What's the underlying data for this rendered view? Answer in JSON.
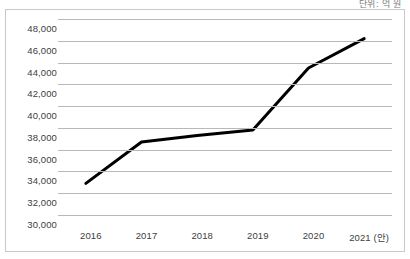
{
  "caption": {
    "text": "단위: 억 원"
  },
  "chart_data": {
    "type": "line",
    "title": "",
    "subtitle": "",
    "xlabel": "",
    "ylabel": "",
    "categories": [
      "2016",
      "2017",
      "2018",
      "2019",
      "2020",
      "2021 (안)"
    ],
    "values": [
      32900,
      36700,
      37300,
      37800,
      43500,
      46200
    ],
    "series": [
      {
        "name": "",
        "values": [
          32900,
          36700,
          37300,
          37800,
          43500,
          46200
        ],
        "color": "#000000"
      }
    ],
    "ylim": [
      30000,
      48000
    ],
    "ytick_values": [
      48000,
      46000,
      44000,
      42000,
      40000,
      38000,
      36000,
      34000,
      32000,
      30000
    ],
    "ytick_labels": [
      "48,000",
      "46,000",
      "44,000",
      "42,000",
      "40,000",
      "38,000",
      "36,000",
      "34,000",
      "32,000",
      "30,000"
    ],
    "xtick_labels": [
      "2016",
      "2017",
      "2018",
      "2019",
      "2020",
      "2021 (안)"
    ],
    "grid": true,
    "grid_axis": "y",
    "grid_color": "#b8b8b8",
    "legend": false,
    "legend_position": "none",
    "line_width": 3,
    "markers": false,
    "plot_background": "#ffffff",
    "frame_border_color": "#c9c9c9",
    "annotations": []
  }
}
